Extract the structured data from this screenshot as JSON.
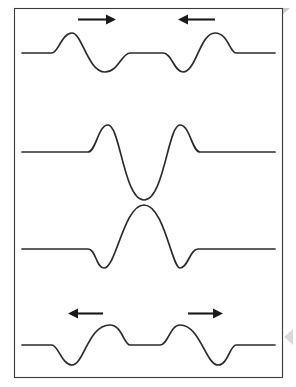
{
  "figure": {
    "background_color": "#ffffff",
    "border_color": "#3a3a3a",
    "curve_color": "#2b2b2b",
    "arrow_color": "#1a1a1a",
    "canvas": {
      "width": 296,
      "height": 387
    },
    "frame": {
      "x": 14,
      "y": 8,
      "width": 269,
      "height": 370
    }
  },
  "panels": [
    {
      "id": "panel-approaching",
      "name": "pulses-approaching",
      "stage_label": "Pulses approaching each other",
      "baseline_y": 53,
      "amplitude": 20,
      "left_pulse": {
        "shape": "crest-then-trough",
        "crest_x": 72,
        "crest_y": 33,
        "trough_x": 105,
        "trough_y": 72
      },
      "right_pulse": {
        "shape": "trough-then-crest",
        "trough_x": 183,
        "trough_y": 72,
        "crest_x": 215,
        "crest_y": 33
      },
      "arrows": [
        {
          "id": "arrow-right-top",
          "direction": "right",
          "x_start": 78,
          "x_end": 113,
          "y": 19,
          "label": "moving right"
        },
        {
          "id": "arrow-left-top",
          "direction": "left",
          "x_start": 178,
          "x_end": 214,
          "y": 19,
          "label": "moving left"
        }
      ]
    },
    {
      "id": "panel-destructive",
      "name": "pulses-overlapping-destructive",
      "stage_label": "Pulses overlapping (destructive interference)",
      "baseline_y": 152,
      "amplitude": 27,
      "left_pulse": {
        "shape": "crest",
        "crest_x": 108,
        "crest_y": 125
      },
      "center": {
        "shape": "deep-trough",
        "trough_x": 144,
        "trough_y": 200
      },
      "right_pulse": {
        "shape": "crest",
        "crest_x": 180,
        "crest_y": 125
      },
      "arrows": []
    },
    {
      "id": "panel-constructive",
      "name": "pulses-overlapping-constructive",
      "stage_label": "Pulses overlapping (constructive interference)",
      "baseline_y": 249,
      "amplitude": 20,
      "left_pulse": {
        "shape": "trough",
        "trough_x": 104,
        "trough_y": 268
      },
      "center": {
        "shape": "tall-crest",
        "crest_x": 144,
        "crest_y": 205
      },
      "right_pulse": {
        "shape": "trough",
        "trough_x": 180,
        "trough_y": 268
      },
      "arrows": []
    },
    {
      "id": "panel-separating",
      "name": "pulses-separating",
      "stage_label": "Pulses moving apart after passing through",
      "baseline_y": 345,
      "amplitude": 20,
      "left_pulse": {
        "shape": "trough-then-crest",
        "trough_x": 72,
        "trough_y": 365,
        "crest_x": 110,
        "crest_y": 325
      },
      "right_pulse": {
        "shape": "crest-then-trough",
        "crest_x": 180,
        "crest_y": 325,
        "trough_x": 218,
        "trough_y": 365
      },
      "arrows": [
        {
          "id": "arrow-left-bottom",
          "direction": "left",
          "x_start": 68,
          "x_end": 103,
          "y": 313,
          "label": "moving left"
        },
        {
          "id": "arrow-right-bottom",
          "direction": "right",
          "x_start": 188,
          "x_end": 222,
          "y": 313,
          "label": "moving right"
        }
      ]
    }
  ],
  "chart_data": {
    "type": "line",
    "xlabel": "",
    "ylabel": "",
    "grid": false,
    "legend": "none",
    "series": [
      {
        "name": "panel-1-approaching",
        "path": "M22,53 L52,53 C58,53 62,33 72,33 C82,33 88,72 105,72 C118,72 122,53 130,53 L163,53 C172,53 174,72 183,72 C196,72 200,33 215,33 C228,33 230,53 236,53 L275,53"
      },
      {
        "name": "panel-2-destructive",
        "path": "M22,152 L88,152 C96,152 98,125 108,125 C120,125 124,200 144,200 C164,200 168,125 180,125 C190,125 192,152 200,152 L275,152"
      },
      {
        "name": "panel-3-constructive",
        "path": "M22,249 L88,249 C96,249 96,268 104,268 C116,268 124,205 144,205 C164,205 172,268 180,268 C188,268 190,249 198,249 L275,249"
      },
      {
        "name": "panel-4-separating",
        "path": "M22,345 L52,345 C58,345 62,365 72,365 C84,365 88,325 110,325 C122,325 124,345 130,345 L160,345 C168,345 170,325 180,325 C200,325 206,365 218,365 C228,365 230,345 236,345 L275,345"
      }
    ]
  },
  "artifacts": {
    "page_edge_marker": {
      "name": "page-edge-triangle",
      "x": 284,
      "y": 328,
      "color": "#d9d9d9"
    },
    "corner_marker": {
      "name": "corner-fold",
      "x": 283,
      "y": 8,
      "color": "#c8c8c8"
    }
  }
}
